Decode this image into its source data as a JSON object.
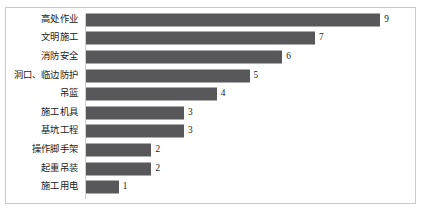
{
  "chart_data": {
    "type": "bar",
    "orientation": "horizontal",
    "title": "",
    "subtitle": "",
    "xlabel": "",
    "ylabel": "",
    "xlim": [
      0,
      10
    ],
    "grid": false,
    "legend": null,
    "bar_color": "#58585a",
    "border_color": "#c8c8c8",
    "background_color": "#ffffff",
    "categories": [
      "高处作业",
      "文明施工",
      "消防安全",
      "洞口、临边防护",
      "吊篮",
      "施工机具",
      "基坑工程",
      "操作脚手架",
      "起重吊装",
      "施工用电"
    ],
    "values": [
      9,
      7,
      6,
      5,
      4,
      3,
      3,
      2,
      2,
      1
    ],
    "value_labels": [
      "9",
      "7",
      "6",
      "5",
      "4",
      "3",
      "3",
      "2",
      "2",
      "1"
    ]
  }
}
